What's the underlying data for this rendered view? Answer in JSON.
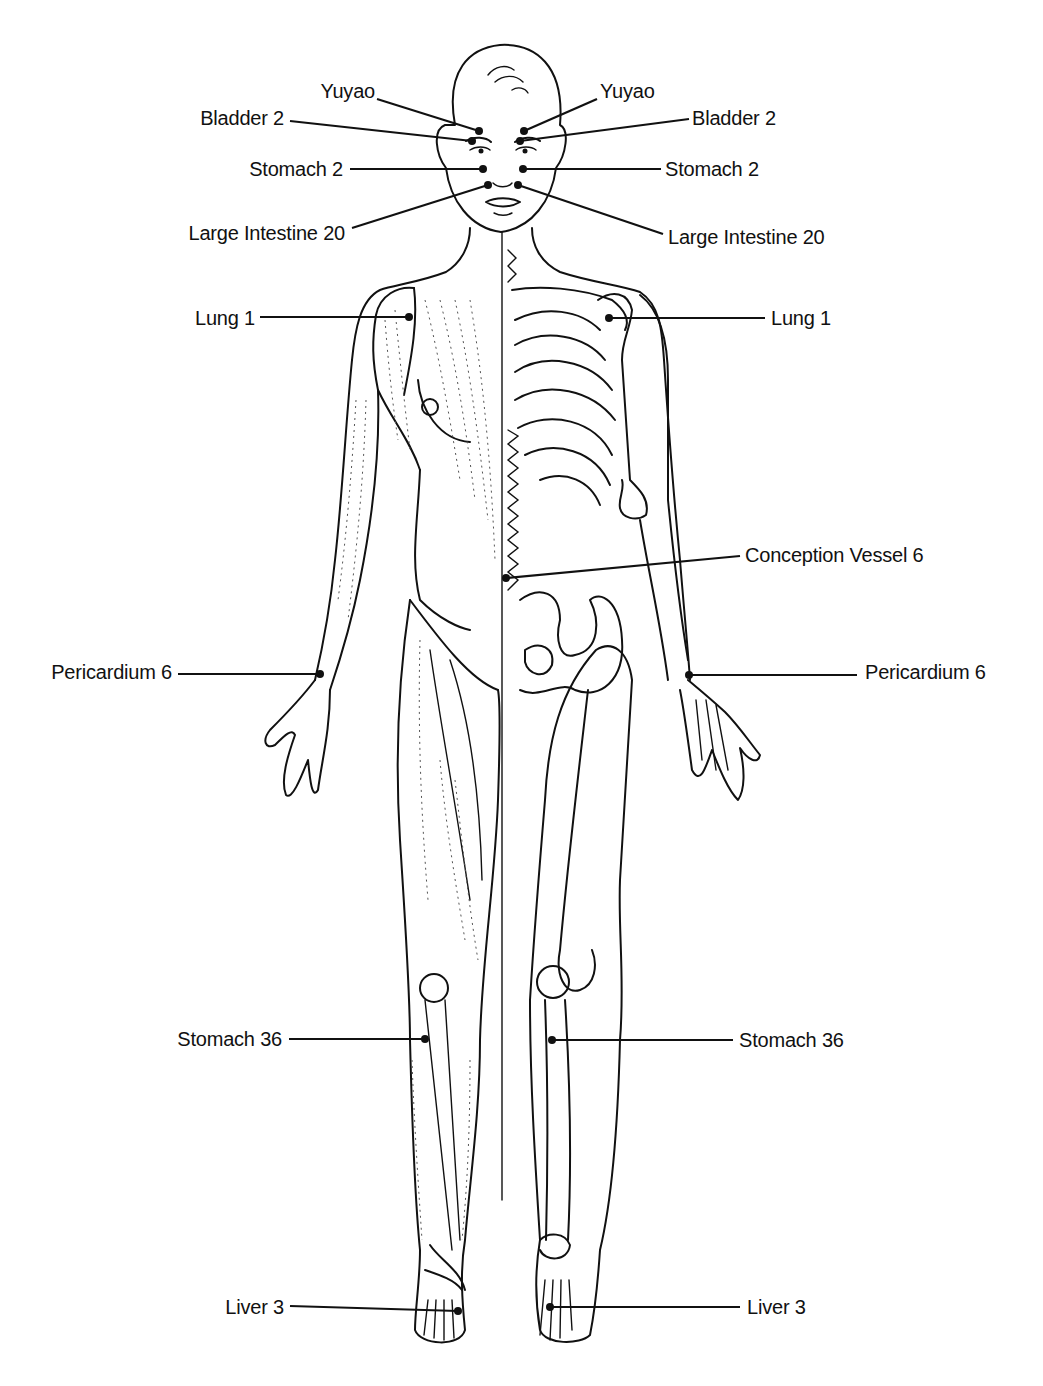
{
  "diagram": {
    "colors": {
      "line": "#111111",
      "background": "#ffffff"
    },
    "points": [
      {
        "id": "yuyao-r",
        "label": "Yuyao",
        "side": "right-of-figure",
        "label_x": 375,
        "label_y": 80,
        "text_align": "end",
        "line": [
          377,
          99,
          479,
          131
        ]
      },
      {
        "id": "yuyao-l",
        "label": "Yuyao",
        "side": "left-of-figure",
        "label_x": 600,
        "label_y": 80,
        "text_align": "start",
        "line": [
          597,
          99,
          524,
          131
        ]
      },
      {
        "id": "bladder2-r",
        "label": "Bladder 2",
        "side": "right-of-figure",
        "label_x": 284,
        "label_y": 107,
        "text_align": "end",
        "line": [
          290,
          121,
          472,
          141
        ]
      },
      {
        "id": "bladder2-l",
        "label": "Bladder 2",
        "side": "left-of-figure",
        "label_x": 692,
        "label_y": 107,
        "text_align": "start",
        "line": [
          689,
          119,
          520,
          141
        ]
      },
      {
        "id": "stomach2-r",
        "label": "Stomach 2",
        "side": "right-of-figure",
        "label_x": 343,
        "label_y": 158,
        "text_align": "end",
        "line": [
          350,
          169,
          483,
          169
        ]
      },
      {
        "id": "stomach2-l",
        "label": "Stomach 2",
        "side": "left-of-figure",
        "label_x": 665,
        "label_y": 158,
        "text_align": "start",
        "line": [
          661,
          169,
          523,
          169
        ]
      },
      {
        "id": "li20-r",
        "label": "Large Intestine 20",
        "side": "right-of-figure",
        "label_x": 345,
        "label_y": 222,
        "text_align": "end",
        "line": [
          352,
          228,
          488,
          185
        ]
      },
      {
        "id": "li20-l",
        "label": "Large Intestine 20",
        "side": "left-of-figure",
        "label_x": 668,
        "label_y": 226,
        "text_align": "start",
        "line": [
          663,
          234,
          518,
          185
        ]
      },
      {
        "id": "lung1-r",
        "label": "Lung 1",
        "side": "right-of-figure",
        "label_x": 255,
        "label_y": 307,
        "text_align": "end",
        "line": [
          260,
          317,
          409,
          317
        ]
      },
      {
        "id": "lung1-l",
        "label": "Lung 1",
        "side": "left-of-figure",
        "label_x": 771,
        "label_y": 307,
        "text_align": "start",
        "line": [
          765,
          318,
          609,
          318
        ]
      },
      {
        "id": "cv6",
        "label": "Conception Vessel 6",
        "side": "center",
        "label_x": 745,
        "label_y": 544,
        "text_align": "start",
        "line": [
          740,
          556,
          506,
          578
        ]
      },
      {
        "id": "pc6-r",
        "label": "Pericardium 6",
        "side": "right-of-figure",
        "label_x": 172,
        "label_y": 661,
        "text_align": "end",
        "line": [
          178,
          674,
          320,
          674
        ]
      },
      {
        "id": "pc6-l",
        "label": "Pericardium 6",
        "side": "left-of-figure",
        "label_x": 865,
        "label_y": 661,
        "text_align": "start",
        "line": [
          857,
          675,
          689,
          675
        ]
      },
      {
        "id": "st36-r",
        "label": "Stomach 36",
        "side": "right-of-figure",
        "label_x": 282,
        "label_y": 1028,
        "text_align": "end",
        "line": [
          289,
          1039,
          425,
          1039
        ]
      },
      {
        "id": "st36-l",
        "label": "Stomach 36",
        "side": "left-of-figure",
        "label_x": 739,
        "label_y": 1029,
        "text_align": "start",
        "line": [
          552,
          1040,
          733,
          1040
        ]
      },
      {
        "id": "liver3-r",
        "label": "Liver 3",
        "side": "right-of-figure",
        "label_x": 284,
        "label_y": 1296,
        "text_align": "end",
        "line": [
          290,
          1306,
          458,
          1311
        ]
      },
      {
        "id": "liver3-l",
        "label": "Liver 3",
        "side": "left-of-figure",
        "label_x": 747,
        "label_y": 1296,
        "text_align": "start",
        "line": [
          550,
          1307,
          740,
          1307
        ]
      }
    ]
  }
}
